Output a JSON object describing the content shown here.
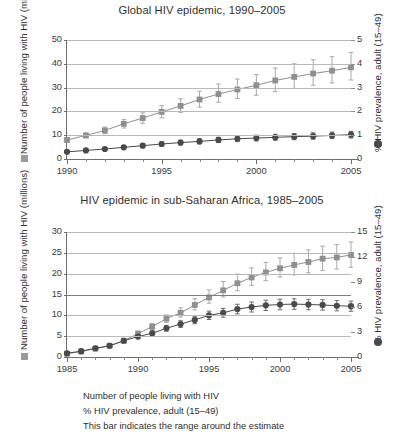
{
  "chart_data": [
    {
      "id": "global",
      "type": "line",
      "title": "Global HIV epidemic, 1990–2005",
      "xlabel": "",
      "ylabel": "Number of people living with HIV (millions)",
      "y2label": "% HIV prevalence, adult (15–49)",
      "xlim": [
        1990,
        2005
      ],
      "ylim": [
        0,
        50
      ],
      "y2lim": [
        0,
        5
      ],
      "yticks": [
        0,
        10,
        20,
        30,
        40,
        50
      ],
      "y2ticks": [
        0,
        1,
        2,
        3,
        4,
        5
      ],
      "xticks": [
        1990,
        1995,
        2000,
        2005
      ],
      "xtick_labels": [
        "1990",
        "1995",
        "2000",
        "2005"
      ],
      "grid": true,
      "legend_position": "below-figure",
      "x": [
        1990,
        1991,
        1992,
        1993,
        1994,
        1995,
        1996,
        1997,
        1998,
        1999,
        2000,
        2001,
        2002,
        2003,
        2004,
        2005
      ],
      "series": [
        {
          "name": "Number of people living with HIV",
          "marker": "square",
          "color": "#8f8f8f",
          "axis": "left",
          "units": "millions",
          "values": [
            8.0,
            9.9,
            12.0,
            14.8,
            17.2,
            19.8,
            22.3,
            25.0,
            27.3,
            29.2,
            31.0,
            33.0,
            34.5,
            35.9,
            37.1,
            38.5
          ],
          "err_low": [
            7.2,
            8.9,
            10.6,
            13.0,
            15.0,
            17.3,
            19.6,
            21.8,
            23.8,
            25.4,
            26.8,
            28.3,
            29.7,
            31.0,
            32.0,
            33.2
          ],
          "err_high": [
            8.8,
            10.9,
            13.4,
            16.6,
            19.4,
            22.4,
            25.3,
            28.5,
            31.5,
            33.6,
            35.5,
            38.2,
            40.0,
            41.7,
            43.0,
            44.8
          ]
        },
        {
          "name": "% HIV prevalence, adult (15–49)",
          "marker": "circle",
          "color": "#4a4a4a",
          "axis": "right",
          "units": "percent",
          "values": [
            0.3,
            0.36,
            0.42,
            0.49,
            0.56,
            0.63,
            0.69,
            0.74,
            0.8,
            0.85,
            0.88,
            0.91,
            0.94,
            0.96,
            0.99,
            1.02
          ],
          "err_low": [
            0.26,
            0.31,
            0.36,
            0.42,
            0.48,
            0.54,
            0.59,
            0.64,
            0.69,
            0.73,
            0.76,
            0.79,
            0.81,
            0.83,
            0.86,
            0.88
          ],
          "err_high": [
            0.34,
            0.41,
            0.48,
            0.56,
            0.64,
            0.72,
            0.79,
            0.85,
            0.91,
            0.97,
            1.0,
            1.04,
            1.07,
            1.1,
            1.13,
            1.16
          ]
        }
      ]
    },
    {
      "id": "sub-saharan-africa",
      "type": "line",
      "title": "HIV epidemic in sub-Saharan Africa, 1985–2005",
      "xlabel": "",
      "ylabel": "Number of people living with HIV (millions)",
      "y2label": "% HIV prevalence, adult (15–49)",
      "xlim": [
        1985,
        2005
      ],
      "ylim": [
        0,
        30
      ],
      "y2lim": [
        0,
        15
      ],
      "yticks": [
        0,
        5,
        10,
        15,
        20,
        25,
        30
      ],
      "y2ticks": [
        0,
        3,
        6,
        9,
        12,
        15
      ],
      "xticks": [
        1985,
        1990,
        1995,
        2000,
        2005
      ],
      "xtick_labels": [
        "1985",
        "1990",
        "1995",
        "2000",
        "2005"
      ],
      "grid": true,
      "legend_position": "below-figure",
      "x": [
        1985,
        1986,
        1987,
        1988,
        1989,
        1990,
        1991,
        1992,
        1993,
        1994,
        1995,
        1996,
        1997,
        1998,
        1999,
        2000,
        2001,
        2002,
        2003,
        2004,
        2005
      ],
      "series": [
        {
          "name": "Number of people living with HIV",
          "marker": "square",
          "color": "#8f8f8f",
          "axis": "left",
          "units": "millions",
          "values": [
            0.8,
            1.3,
            2.0,
            2.7,
            3.9,
            5.6,
            7.3,
            9.2,
            10.6,
            12.5,
            14.3,
            16.0,
            17.7,
            19.1,
            20.3,
            21.3,
            22.1,
            22.8,
            23.6,
            23.9,
            24.5
          ],
          "err_low": [
            0.7,
            1.1,
            1.8,
            2.4,
            3.5,
            5.0,
            6.6,
            8.3,
            9.6,
            11.3,
            12.9,
            14.4,
            15.9,
            17.2,
            18.3,
            19.2,
            19.7,
            20.2,
            20.8,
            21.1,
            21.5
          ],
          "err_high": [
            0.9,
            1.5,
            2.2,
            3.0,
            4.3,
            6.2,
            8.0,
            10.1,
            11.8,
            14.0,
            16.1,
            18.1,
            19.9,
            21.4,
            22.7,
            23.8,
            24.9,
            25.7,
            26.6,
            27.0,
            27.6
          ]
        },
        {
          "name": "% HIV prevalence, adult (15–49)",
          "marker": "circle",
          "color": "#4a4a4a",
          "axis": "right",
          "units": "percent",
          "values": [
            0.45,
            0.7,
            1.05,
            1.35,
            1.95,
            2.45,
            2.85,
            3.45,
            3.95,
            4.45,
            5.0,
            5.3,
            5.75,
            6.0,
            6.2,
            6.3,
            6.35,
            6.3,
            6.25,
            6.15,
            6.1
          ],
          "err_low": [
            0.4,
            0.62,
            0.94,
            1.2,
            1.75,
            2.2,
            2.56,
            3.1,
            3.55,
            4.0,
            4.5,
            4.78,
            5.18,
            5.4,
            5.58,
            5.67,
            5.72,
            5.67,
            5.63,
            5.54,
            5.49
          ],
          "err_high": [
            0.5,
            0.78,
            1.16,
            1.5,
            2.15,
            2.7,
            3.14,
            3.8,
            4.35,
            4.9,
            5.5,
            5.83,
            6.33,
            6.6,
            6.82,
            6.93,
            6.99,
            6.93,
            6.88,
            6.77,
            6.71
          ]
        }
      ]
    }
  ],
  "figure_legend": {
    "line1": "Number of people living with HIV",
    "line2": "% HIV prevalence, adult (15–49)",
    "line3": "This bar indicates the range around the estimate"
  },
  "colors": {
    "series_square": "#8f8f8f",
    "series_circle": "#4a4a4a",
    "gridline": "#b9b9b9",
    "axis": "#6e6e6e",
    "text": "#2f2f2f"
  }
}
